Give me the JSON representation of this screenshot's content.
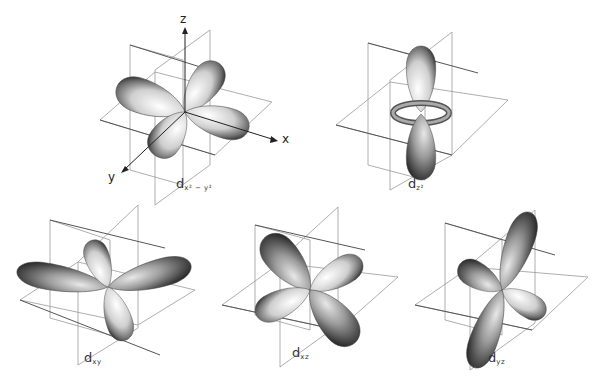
{
  "diagram": {
    "orbitals": [
      {
        "id": "dx2-y2",
        "label_main": "d",
        "label_sub": "x² − y²"
      },
      {
        "id": "dz2",
        "label_main": "d",
        "label_sub": "z²"
      },
      {
        "id": "dxy",
        "label_main": "d",
        "label_sub": "xy"
      },
      {
        "id": "dxz",
        "label_main": "d",
        "label_sub": "xz"
      },
      {
        "id": "dyz",
        "label_main": "d",
        "label_sub": "yz"
      }
    ],
    "axes": {
      "x": "x",
      "y": "y",
      "z": "z"
    },
    "colors": {
      "background": "#ffffff",
      "lobe_light": "#f2f2f2",
      "lobe_dark": "#2a2a2a",
      "plane": "#888888"
    }
  }
}
